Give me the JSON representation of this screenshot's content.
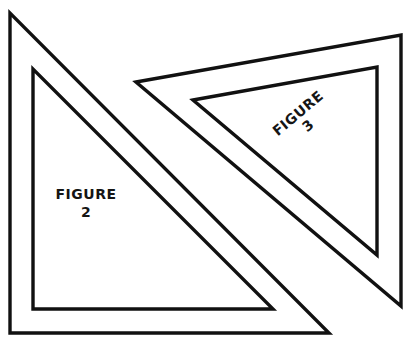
{
  "diagram": {
    "colors": {
      "background": "#ffffff",
      "stroke": "#111111",
      "text": "#151515"
    },
    "figures": [
      {
        "id": "figure-2",
        "label_line1": "FIGURE",
        "label_line2": "2",
        "shape": "right-triangle set square",
        "outer_points": "10,13 10,333 329,333",
        "inner_points": "33,69 33,309 273,309"
      },
      {
        "id": "figure-3",
        "label_line1": "FIGURE",
        "label_line2": "3",
        "shape": "right-triangle set square (rotated)",
        "outer_points": "136,82 401,35 401,306",
        "inner_points": "193,100 377,67 377,255",
        "label_rotation_deg": -40
      }
    ]
  }
}
